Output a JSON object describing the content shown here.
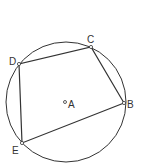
{
  "diagram": {
    "type": "cyclic-quadrilateral",
    "center": {
      "label": "A",
      "x": 65,
      "y": 102
    },
    "circle": {
      "cx": 66,
      "cy": 102,
      "r": 60
    },
    "points": [
      {
        "label": "B",
        "x": 124,
        "y": 103
      },
      {
        "label": "C",
        "x": 91,
        "y": 47
      },
      {
        "label": "D",
        "x": 19,
        "y": 64
      },
      {
        "label": "E",
        "x": 22,
        "y": 143
      }
    ],
    "segments": [
      "DC",
      "CB",
      "BE",
      "ED"
    ],
    "colors": {
      "stroke": "#333333",
      "background": "#ffffff"
    }
  }
}
